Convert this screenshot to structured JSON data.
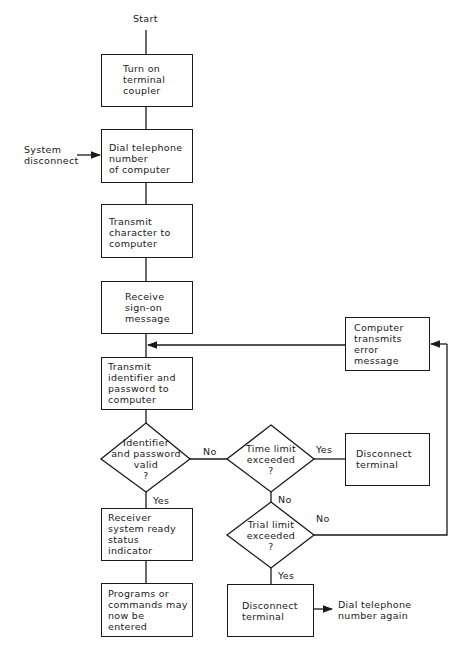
{
  "flowchart": {
    "start_label": "Start",
    "external_input": "System\ndisconnect",
    "steps": [
      {
        "id": "turn-on",
        "text": "Turn on\nterminal\ncoupler"
      },
      {
        "id": "dial",
        "text": "Dial telephone\nnumber\nof computer"
      },
      {
        "id": "transmit-char",
        "text": "Transmit\ncharacter to\ncomputer"
      },
      {
        "id": "receive-signon",
        "text": "Receive\nsign-on\nmessage"
      },
      {
        "id": "transmit-id",
        "text": "Transmit\nidentifier and\npassword to\ncomputer"
      },
      {
        "id": "ready",
        "text": "Receiver\nsystem ready\nstatus\nindicator"
      },
      {
        "id": "programs",
        "text": "Programs or\ncommands may\nnow be\nentered"
      },
      {
        "id": "error",
        "text": "Computer\ntransmits\nerror\nmessage"
      },
      {
        "id": "disconnect-1",
        "text": "Disconnect\nterminal"
      },
      {
        "id": "disconnect-2",
        "text": "Disconnect\nterminal"
      }
    ],
    "decisions": [
      {
        "id": "valid",
        "text": "Identifier\nand password\nvalid\n?",
        "yes": "Yes",
        "no": "No"
      },
      {
        "id": "time-limit",
        "text": "Time limit\nexceeded\n?",
        "yes": "Yes",
        "no": "No"
      },
      {
        "id": "trial-limit",
        "text": "Trial limit\nexceeded\n?",
        "yes": "Yes",
        "no": "No"
      }
    ],
    "final_output": "Dial telephone\nnumber again"
  }
}
